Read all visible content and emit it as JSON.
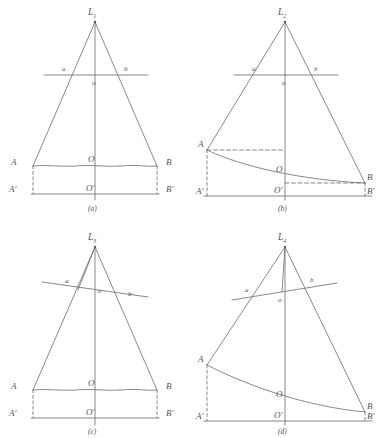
{
  "figure": {
    "background": "#ffffff",
    "line_color": "#6b6b6b",
    "label_color": "#555555",
    "panels": [
      {
        "caption": "(a)",
        "source_label": "L",
        "source_subscript": "1",
        "aperture_left_label": "a",
        "aperture_right_label": "b",
        "aperture_center_label": "o",
        "ground_left_label": "A",
        "ground_right_label": "B",
        "ground_center_label": "O",
        "datum_left_label": "A'",
        "datum_right_label": "B'",
        "datum_center_label": "O'",
        "ground_type": "wavy-level",
        "aperture_tilt": "horizontal",
        "has_apex_drop_line": false
      },
      {
        "caption": "(b)",
        "source_label": "L",
        "source_subscript": "2",
        "aperture_left_label": "a",
        "aperture_right_label": "b",
        "aperture_center_label": "o",
        "ground_left_label": "A",
        "ground_right_label": "B",
        "ground_center_label": "O",
        "datum_left_label": "A'",
        "datum_right_label": "B'",
        "datum_center_label": "O'",
        "ground_type": "sloping-curve",
        "aperture_tilt": "horizontal",
        "has_apex_drop_line": false
      },
      {
        "caption": "(c)",
        "source_label": "L",
        "source_subscript": "3",
        "aperture_left_label": "a",
        "aperture_right_label": "b",
        "aperture_center_label": "o",
        "ground_left_label": "A",
        "ground_right_label": "B",
        "ground_center_label": "O",
        "datum_left_label": "A'",
        "datum_right_label": "B'",
        "datum_center_label": "O'",
        "ground_type": "wavy-level",
        "aperture_tilt": "tilted",
        "has_apex_drop_line": true
      },
      {
        "caption": "(d)",
        "source_label": "L",
        "source_subscript": "4",
        "aperture_left_label": "a",
        "aperture_right_label": "b",
        "aperture_center_label": "o",
        "ground_left_label": "A",
        "ground_right_label": "B",
        "ground_center_label": "O",
        "datum_left_label": "A'",
        "datum_right_label": "B'",
        "datum_center_label": "O'",
        "ground_type": "sloping-curve",
        "aperture_tilt": "tilted",
        "has_apex_drop_line": true
      }
    ]
  }
}
